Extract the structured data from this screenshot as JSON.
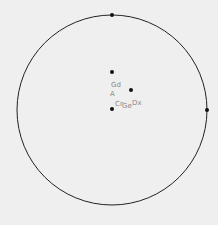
{
  "diagram": {
    "type": "polar-position-plot",
    "circle": {
      "cx": 112,
      "cy": 110,
      "r": 95,
      "stroke": "#222222"
    },
    "boundary_markers": [
      {
        "x": 112,
        "y": 15
      },
      {
        "x": 207,
        "y": 110
      }
    ],
    "points": [
      {
        "x": 112,
        "y": 72
      },
      {
        "x": 131,
        "y": 90
      },
      {
        "x": 112,
        "y": 109
      }
    ],
    "labels": [
      {
        "text": "Gd",
        "x": 111,
        "y": 86
      },
      {
        "text": "A",
        "x": 110,
        "y": 95
      },
      {
        "text": "Cr",
        "x": 115,
        "y": 105
      },
      {
        "text": "Ge",
        "x": 122,
        "y": 107
      },
      {
        "text": "Dx",
        "x": 132,
        "y": 104
      }
    ],
    "background": "#efefef",
    "label_color": "#8a8a8a"
  }
}
